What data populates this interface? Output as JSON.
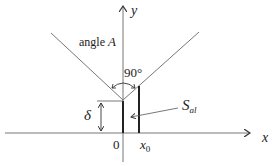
{
  "diagram": {
    "axes": {
      "x_label": "x",
      "y_label": "y"
    },
    "labels": {
      "angle_text": "angle ",
      "angle_var": "A",
      "right_angle": "90°",
      "delta": "δ",
      "origin": "0",
      "x0_main": "x",
      "x0_sub": "0",
      "s_main": "S",
      "s_sub": "al"
    },
    "colors": {
      "line": "#333333",
      "thin_line": "#666666",
      "background": "#ffffff"
    }
  }
}
